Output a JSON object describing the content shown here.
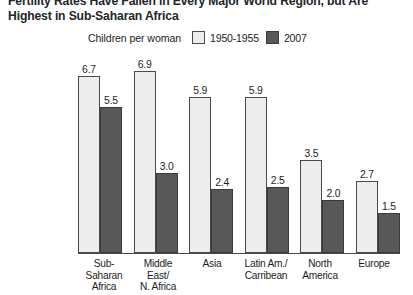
{
  "title": {
    "line1": "Fertility Rates Have Fallen in Every Major World Region, but Are",
    "line2": "Highest in Sub-Saharan Africa"
  },
  "legend": {
    "caption": "Children per woman",
    "entries": [
      {
        "label": "1950-1955",
        "color": "#ededed",
        "swatch": "light"
      },
      {
        "label": "2007",
        "color": "#585858",
        "swatch": "dark"
      }
    ]
  },
  "chart_data": {
    "type": "bar",
    "title": "Fertility Rates Have Fallen in Every Major World Region, but Are Highest in Sub-Saharan Africa",
    "xlabel": "",
    "ylabel": "Children per woman",
    "ylim": [
      0,
      7.3
    ],
    "grid": false,
    "legend_position": "top",
    "categories": [
      "Sub-Saharan\nAfrica",
      "Middle East/\nN. Africa",
      "Asia",
      "Latin Am./\nCarribean",
      "North\nAmerica",
      "Europe"
    ],
    "series": [
      {
        "name": "1950-1955",
        "color": "#ededed",
        "values": [
          6.7,
          6.9,
          5.9,
          5.9,
          3.5,
          2.7
        ]
      },
      {
        "name": "2007",
        "color": "#585858",
        "values": [
          5.5,
          3.0,
          2.4,
          2.5,
          2.0,
          1.5
        ]
      }
    ],
    "value_labels": [
      [
        "6.7",
        "5.5"
      ],
      [
        "6.9",
        "3.0"
      ],
      [
        "5.9",
        "2.4"
      ],
      [
        "5.9",
        "2.5"
      ],
      [
        "3.5",
        "2.0"
      ],
      [
        "2.7",
        "1.5"
      ]
    ]
  }
}
